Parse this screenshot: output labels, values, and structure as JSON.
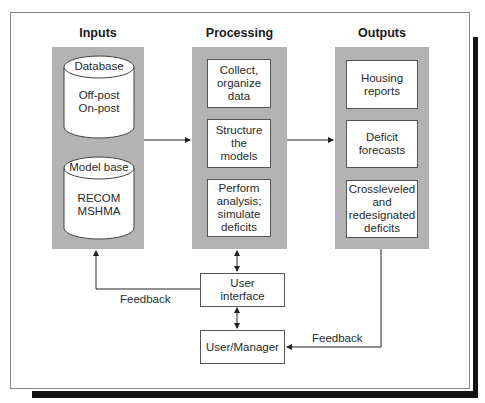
{
  "diagram": {
    "columns": [
      {
        "id": "inputs",
        "title": "Inputs"
      },
      {
        "id": "processing",
        "title": "Processing"
      },
      {
        "id": "outputs",
        "title": "Outputs"
      }
    ],
    "inputs": {
      "database": {
        "label": "Database",
        "contents": "Off-post\nOn-post"
      },
      "model_base": {
        "label": "Model base",
        "contents": "RECOM\nMSHMA"
      }
    },
    "processing": {
      "steps": [
        {
          "text": "Collect,\norganize\ndata"
        },
        {
          "text": "Structure\nthe\nmodels"
        },
        {
          "text": "Perform\nanalysis;\nsimulate\ndeficits"
        }
      ]
    },
    "outputs": {
      "items": [
        {
          "text": "Housing\nreports"
        },
        {
          "text": "Deficit\nforecasts"
        },
        {
          "text": "Crossleveled\nand\nredesignated\ndeficits"
        }
      ]
    },
    "user_interface": {
      "text": "User\ninterface"
    },
    "user_manager": {
      "text": "User/Manager"
    },
    "feedback_labels": {
      "left": "Feedback",
      "right": "Feedback"
    },
    "colors": {
      "panel_gray": "#b3b3b3",
      "box_border": "#555555",
      "shadow": "#111111",
      "line": "#222222"
    }
  }
}
